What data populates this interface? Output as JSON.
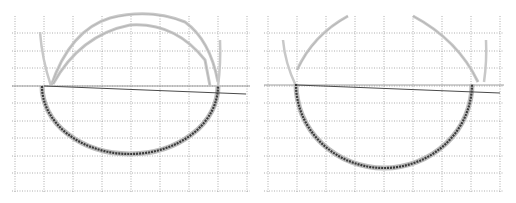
{
  "figure": {
    "panels": [
      {
        "id": "left",
        "offset_x": 0,
        "grid": {
          "x_lines": [
            15,
            44,
            73,
            102,
            131,
            160,
            189,
            218,
            247
          ],
          "y_lines": [
            33,
            51,
            68,
            86,
            103,
            121,
            138,
            156,
            173,
            191
          ],
          "x_min": 12,
          "x_max": 250,
          "y_min": 16,
          "y_max": 193
        },
        "lower_arc": {
          "cx": 130,
          "cy": 86,
          "rx": 88,
          "ry": 68
        },
        "outer_arc_left": {
          "x0": 40,
          "y0": 32,
          "x1": 51,
          "y1": 86
        },
        "upper_arcs": [
          {
            "d": "M51,86 Q70,30 110,18 Q150,8 185,22 Q210,40 218,82"
          },
          {
            "d": "M53,84 Q80,35 130,25 Q175,22 205,60 L210,86"
          }
        ],
        "right_outer": {
          "x0": 218,
          "y0": 86,
          "x1": 218,
          "y1": 40
        },
        "line": {
          "x0": 44,
          "y0": 86,
          "x1": 246,
          "y1": 94
        },
        "hline_y": 86
      },
      {
        "id": "right",
        "offset_x": 258,
        "grid": {
          "x_lines": [
            10,
            39,
            68,
            97,
            126,
            155,
            184,
            213,
            242
          ],
          "y_lines": [
            33,
            51,
            68,
            86,
            103,
            121,
            138,
            156,
            173,
            191
          ],
          "x_min": 6,
          "x_max": 246,
          "y_min": 16,
          "y_max": 193
        },
        "lower_arc": {
          "cx": 126,
          "cy": 84,
          "rx": 88,
          "ry": 84
        },
        "outer_arc_left": {
          "x0": 25,
          "y0": 40,
          "x1": 38,
          "y1": 86
        },
        "upper_arcs": [
          {
            "d": "M39,70 Q55,35 90,16"
          },
          {
            "d": "M155,16 Q200,40 220,82"
          }
        ],
        "right_outer": {
          "x0": 226,
          "y0": 82,
          "x1": 226,
          "y1": 40
        },
        "line": {
          "x0": 39,
          "y0": 85,
          "x1": 242,
          "y1": 93
        },
        "hline_y": 85
      }
    ],
    "colors": {
      "grid": "#9a9a9a",
      "curve_dark": "#3a3a3a",
      "curve_light": "#c8c8c8",
      "line": "#4a4a4a"
    }
  }
}
